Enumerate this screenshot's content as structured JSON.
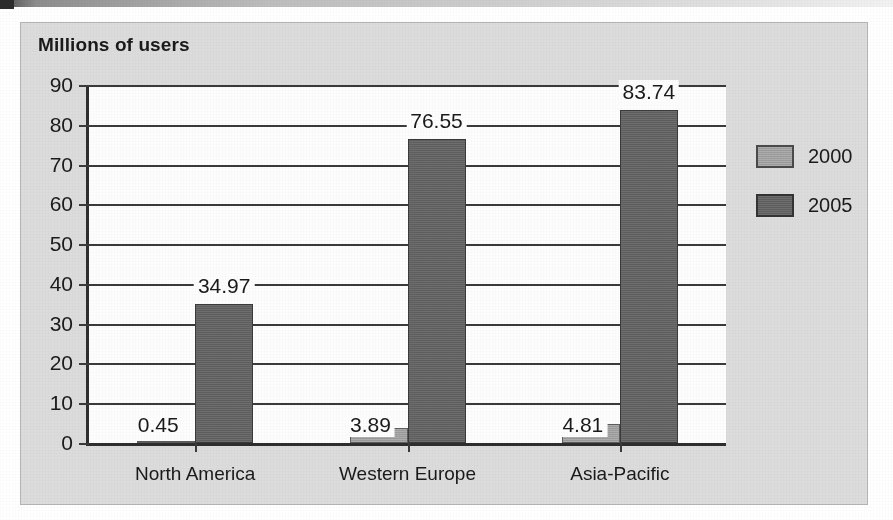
{
  "figure": {
    "title": "Millions of users",
    "panel_color": "#dcdcdc",
    "plot_color": "#fdfdfd"
  },
  "chart_data": {
    "type": "bar",
    "title": "Millions of users",
    "xlabel": "",
    "ylabel": "Millions of users",
    "categories": [
      "North America",
      "Western Europe",
      "Asia-Pacific"
    ],
    "series": [
      {
        "name": "2000",
        "color": "#9b9b9b",
        "values": [
          0.45,
          3.89,
          4.81
        ],
        "labels": [
          "0.45",
          "3.89",
          "4.81"
        ]
      },
      {
        "name": "2005",
        "color": "#5e5e5e",
        "values": [
          34.97,
          76.55,
          83.74
        ],
        "labels": [
          "34.97",
          "76.55",
          "83.74"
        ]
      }
    ],
    "ylim": [
      0,
      90
    ],
    "yticks": [
      0,
      10,
      20,
      30,
      40,
      50,
      60,
      70,
      80,
      90
    ],
    "ytick_labels": [
      "0",
      "10",
      "20",
      "30",
      "40",
      "50",
      "60",
      "70",
      "80",
      "90"
    ],
    "grid": true,
    "grid_axis": "y",
    "legend_position": "right"
  },
  "legend": {
    "entries": [
      {
        "label": "2000",
        "color": "#9b9b9b"
      },
      {
        "label": "2005",
        "color": "#5e5e5e"
      }
    ]
  }
}
